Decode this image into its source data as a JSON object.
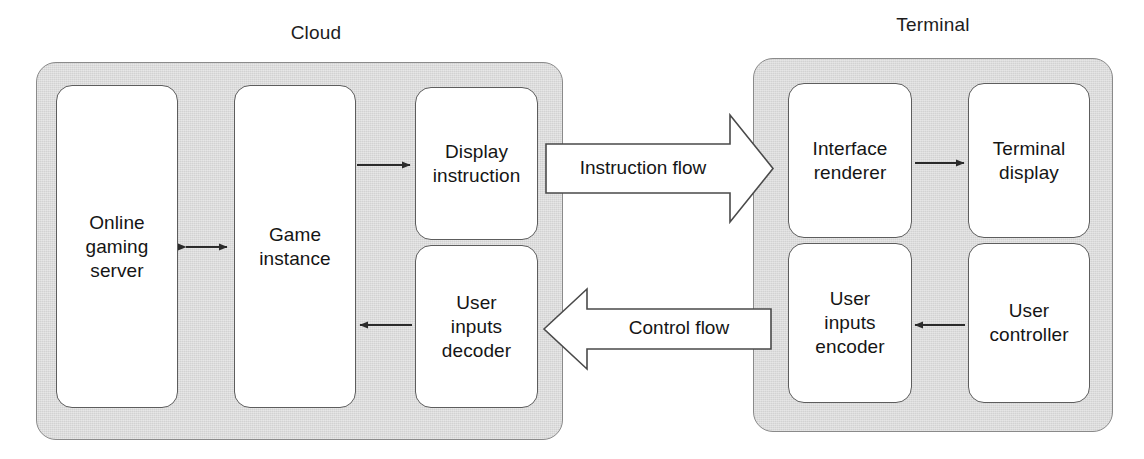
{
  "diagram": {
    "title_cloud": "Cloud",
    "title_terminal": "Terminal",
    "cloud": {
      "nodes": [
        {
          "id": "online-gaming-server",
          "label": "Online\ngaming\nserver"
        },
        {
          "id": "game-instance",
          "label": "Game\ninstance"
        },
        {
          "id": "display-instruction",
          "label": "Display\ninstruction"
        },
        {
          "id": "user-inputs-decoder",
          "label": "User\ninputs\ndecoder"
        }
      ]
    },
    "terminal": {
      "nodes": [
        {
          "id": "interface-renderer",
          "label": "Interface\nrenderer"
        },
        {
          "id": "terminal-display",
          "label": "Terminal\ndisplay"
        },
        {
          "id": "user-inputs-encoder",
          "label": "User\ninputs\nencoder"
        },
        {
          "id": "user-controller",
          "label": "User\ncontroller"
        }
      ]
    },
    "flows": [
      {
        "id": "instruction-flow",
        "label": "Instruction flow",
        "direction": "right"
      },
      {
        "id": "control-flow",
        "label": "Control flow",
        "direction": "left"
      }
    ],
    "colors": {
      "container_fill": "#d2d2d2",
      "container_stroke": "#8a8a8a",
      "node_fill": "#ffffff",
      "node_stroke": "#5d5d5d",
      "arrow_stroke": "#2b2b2b",
      "text": "#151515",
      "background": "#ffffff"
    }
  }
}
